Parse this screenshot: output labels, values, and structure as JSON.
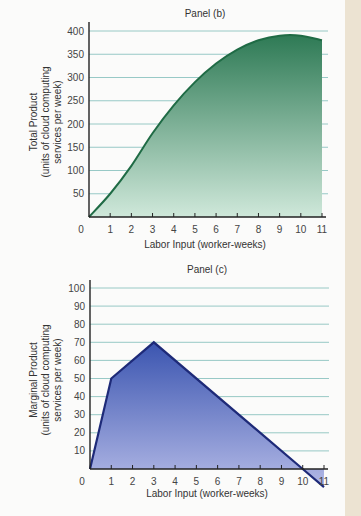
{
  "chart_data": [
    {
      "type": "area",
      "title": "Panel (b)",
      "xlabel": "Labor Input (worker-weeks)",
      "ylabel": "Total Product (units of cloud computing services per week)",
      "ylabel_lines": [
        "Total Product",
        "(units of cloud computing",
        "services per week)"
      ],
      "x": [
        0,
        1,
        2,
        3,
        4,
        5,
        6,
        7,
        8,
        9,
        10,
        11
      ],
      "values": [
        0,
        50,
        110,
        180,
        240,
        290,
        330,
        360,
        380,
        390,
        390,
        380
      ],
      "xticks": [
        "0",
        "1",
        "2",
        "3",
        "4",
        "5",
        "6",
        "7",
        "8",
        "9",
        "10",
        "11"
      ],
      "yticks": [
        "50",
        "100",
        "150",
        "200",
        "250",
        "300",
        "350",
        "400"
      ],
      "xlim": [
        0,
        11
      ],
      "ylim": [
        0,
        400
      ],
      "grid": true,
      "colors": {
        "line": "#1f6b45",
        "fill_top": "#2e7a55",
        "fill_bottom": "#cfe8da",
        "grid": "#8cc3c0"
      }
    },
    {
      "type": "area",
      "title": "Panel (c)",
      "xlabel": "Labor Input (worker-weeks)",
      "ylabel": "Marginal Product (units of cloud computing services per week)",
      "ylabel_lines": [
        "Marginal Product",
        "(units of cloud computing",
        "services per week)"
      ],
      "x": [
        0,
        1,
        3,
        10,
        11
      ],
      "values": [
        0,
        50,
        70,
        0,
        -10
      ],
      "per_worker": {
        "x": [
          1,
          2,
          3,
          4,
          5,
          6,
          7,
          8,
          9,
          10,
          11
        ],
        "values": [
          50,
          60,
          70,
          60,
          50,
          40,
          30,
          20,
          10,
          0,
          -10
        ]
      },
      "xticks": [
        "0",
        "1",
        "2",
        "3",
        "4",
        "5",
        "6",
        "7",
        "8",
        "9",
        "10",
        "11"
      ],
      "yticks": [
        "10",
        "20",
        "30",
        "40",
        "50",
        "60",
        "70",
        "80",
        "90",
        "100"
      ],
      "xlim": [
        0,
        11
      ],
      "ylim": [
        0,
        100
      ],
      "grid": true,
      "colors": {
        "line": "#1e2a78",
        "fill_top": "#3b55b0",
        "fill_bottom": "#b3b9e6",
        "grid": "#8cc3c0"
      }
    }
  ]
}
